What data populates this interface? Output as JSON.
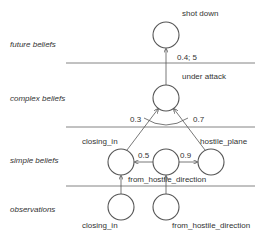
{
  "levels": {
    "future": "future beliefs",
    "complex": "complex beliefs",
    "simple": "simple beliefs",
    "observations": "observations"
  },
  "nodes": {
    "shot_down": "shot down",
    "under_attack": "under attack",
    "closing_in": "closing_in",
    "from_hostile_direction": "from_hostile_direction",
    "hostile_plane": "hostile_plane",
    "obs_closing_in": "closing_in",
    "obs_from_hostile_direction": "from_hostile_direction"
  },
  "edges": {
    "under_attack_to_shot_down": "0.4; 5",
    "closing_in_to_under_attack": "0.3",
    "hostile_plane_to_under_attack": "0.7",
    "fhd_to_closing_in": "0.5",
    "fhd_to_hostile_plane": "0.9"
  },
  "colors": {
    "stroke": "#555555",
    "line": "#666666",
    "text": "#333333"
  }
}
